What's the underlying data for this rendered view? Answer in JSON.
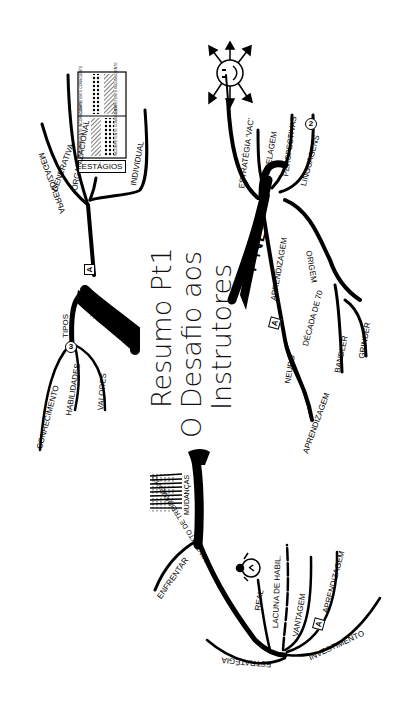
{
  "title": {
    "line1": "Resumo Pt1",
    "line2": "O Desafio aos",
    "line3": "Instrutores"
  },
  "colors": {
    "ink": "#000000",
    "background": "#ffffff"
  },
  "branches": {
    "aprendizagem_top": {
      "label": "APRENDIZAGEM",
      "badge": "A",
      "children": [
        "GENERATIVA",
        "ORGANIZACIONAL",
        "INDIVIDUAL"
      ],
      "estagios": {
        "label": "ESTÁGIOS",
        "cells": [
          "INCOMPETENTE INCONSCIENTE",
          "INCOMPETENTE CONSCIENTE",
          "COMPETENTE CONSCIENTE",
          "COMPETENTE INCONSCIENTE"
        ]
      }
    },
    "treinamento": {
      "label": "TREINAMENTO",
      "tipos": {
        "label": "TIPOS",
        "badge": "3",
        "children": [
          "CONHECIMENTO",
          "HABILIDADES",
          "VALORES"
        ]
      }
    },
    "pnl": {
      "label": "PNL",
      "badge": "2",
      "children": [
        "ESTRATÉGIA 'VAC'",
        "MODELAGEM",
        "PERSPECTIVAS",
        "LINGUAGENS",
        "APRENDIZAGEM",
        "ORIGEM"
      ],
      "origem_children": [
        "DÉCADA DE 70",
        "BANDLER",
        "GRINDER"
      ],
      "aprendizagem_children": [
        "NEURO",
        "APRENDIZAGEM"
      ],
      "aprendizagem_badge": "A",
      "icon": "compass-face-icon"
    },
    "mudancas": {
      "label": "MUDANÇAS",
      "children": [
        "ENFRENTAR",
        "CONTEXTO DE TREINAMENTO"
      ],
      "contexto_children": [
        "REAL",
        "LACUNA DE HABIL.",
        "VANTAGEM",
        "APRENDIZAGEM",
        "INVESTIMENTO",
        "ESTRATÉGIA"
      ],
      "contexto_badge": "A",
      "icon": "stopwatch-icon"
    }
  }
}
